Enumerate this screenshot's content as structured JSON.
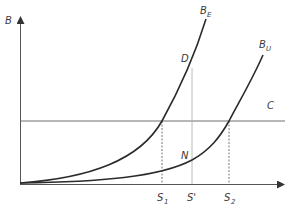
{
  "diagram": {
    "type": "economic-curve-diagram",
    "axes": {
      "y_label": "B",
      "x_label": ""
    },
    "curves": [
      {
        "id": "BE",
        "label_main": "B",
        "label_sub": "E",
        "description": "steeper convex curve"
      },
      {
        "id": "BU",
        "label_main": "B",
        "label_sub": "U",
        "description": "flatter convex curve"
      }
    ],
    "horizontal_line": {
      "label": "C"
    },
    "points": [
      {
        "label": "D",
        "on_curve": "BE"
      },
      {
        "label": "N",
        "on_curve": "BU"
      }
    ],
    "x_markers": [
      {
        "label_main": "S",
        "label_sub": "1",
        "style": "dashed"
      },
      {
        "label_main": "S'",
        "label_sub": "",
        "style": "solid-gray"
      },
      {
        "label_main": "S",
        "label_sub": "2",
        "style": "dashed"
      }
    ],
    "colors": {
      "axis": "#555555",
      "curve": "#2b2b2b",
      "line_c": "#6e6e6e",
      "guide": "#9a9a9a",
      "text": "#3a3a3a"
    }
  }
}
